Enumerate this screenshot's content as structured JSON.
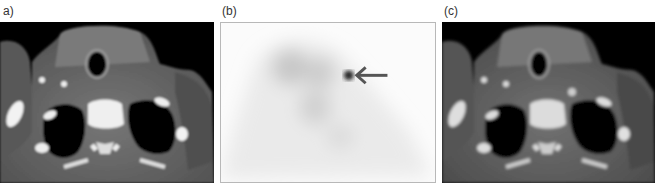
{
  "figure": {
    "panels": [
      {
        "id": "a",
        "label": "a)",
        "modality": "CT axial slice (neck/upper thorax)"
      },
      {
        "id": "b",
        "label": "(b)",
        "modality": "Scintigraphy (planar nuclear image)",
        "annotation": "arrow pointing to focal uptake"
      },
      {
        "id": "c",
        "label": "(c)",
        "modality": "Fused / contrast CT axial slice"
      }
    ]
  },
  "colors": {
    "background": "#ffffff",
    "ct_background": "#000000",
    "soft_tissue": "#6e6e6e",
    "bone": "#f2f2f2",
    "lung": "#050505",
    "scan_background": "#fbfbfb",
    "arrow": "#555555"
  }
}
